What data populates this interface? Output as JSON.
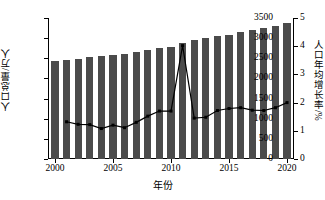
{
  "chart_data": {
    "type": "bar",
    "title": "",
    "xlabel": "年份",
    "ylabel": "人口总量/万人",
    "y2label": "人口年均增长率/%",
    "grid": false,
    "legend": "none",
    "xlim": [
      1999.4,
      2020.6
    ],
    "ylim": [
      0,
      3500
    ],
    "y2lim": [
      0,
      5
    ],
    "yticks": [
      0,
      500,
      1000,
      1500,
      2000,
      2500,
      3000,
      3500
    ],
    "y2ticks": [
      0,
      1,
      2,
      3,
      4,
      5
    ],
    "xticks": [
      2000,
      2005,
      2010,
      2015,
      2020
    ],
    "xticklabels": [
      "2000",
      "2005",
      "2010",
      "2015",
      "2020"
    ],
    "yticklabels": [
      "0",
      "500",
      "1000",
      "1500",
      "2000",
      "2500",
      "3000",
      "3500"
    ],
    "y2ticklabels": [
      "0",
      "1",
      "2",
      "3",
      "4",
      "5"
    ],
    "categories": [
      2000,
      2001,
      2002,
      2003,
      2004,
      2005,
      2006,
      2007,
      2008,
      2009,
      2010,
      2011,
      2012,
      2013,
      2014,
      2015,
      2016,
      2017,
      2018,
      2019,
      2020
    ],
    "series": [
      {
        "name": "人口总量/万人",
        "type": "bar",
        "axis": "left",
        "color": "#4b4b4b",
        "values": [
          2440,
          2470,
          2490,
          2520,
          2560,
          2580,
          2610,
          2650,
          2700,
          2750,
          2790,
          2880,
          2950,
          3000,
          3050,
          3090,
          3150,
          3200,
          3250,
          3310,
          3380
        ]
      },
      {
        "name": "人口年均增长率/%",
        "type": "line",
        "axis": "right",
        "color": "#000000",
        "marker": "square",
        "values": [
          null,
          1.32,
          1.23,
          1.22,
          1.08,
          1.2,
          1.11,
          1.3,
          1.52,
          1.7,
          1.7,
          4.02,
          1.45,
          1.48,
          1.72,
          1.79,
          1.82,
          1.73,
          1.72,
          1.82,
          2.0
        ]
      }
    ]
  }
}
